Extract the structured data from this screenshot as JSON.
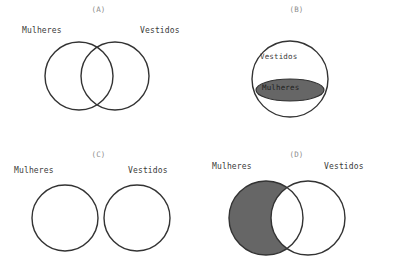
{
  "figure": {
    "sets": {
      "women": "Mulheres",
      "dresses": "Vestidos"
    },
    "colors": {
      "stroke": "#333333",
      "fill_gray": "#666666",
      "background": "#ffffff",
      "label_text": "#3a3a3a",
      "panel_label_text": "#8d8d8d"
    },
    "panels": [
      {
        "id": "A",
        "caption": "(A)",
        "relation": "overlapping",
        "left_label": "Mulheres",
        "right_label": "Vestidos",
        "shaded": "none"
      },
      {
        "id": "B",
        "caption": "(B)",
        "relation": "subset",
        "outer_label": "Vestidos",
        "inner_label": "Mulheres",
        "shaded": "inner-ellipse"
      },
      {
        "id": "C",
        "caption": "(C)",
        "relation": "disjoint",
        "left_label": "Mulheres",
        "right_label": "Vestidos",
        "shaded": "none"
      },
      {
        "id": "D",
        "caption": "(D)",
        "relation": "overlapping",
        "left_label": "Mulheres",
        "right_label": "Vestidos",
        "shaded": "left-minus-intersection"
      }
    ]
  }
}
